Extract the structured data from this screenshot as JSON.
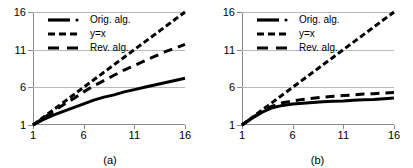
{
  "figure": {
    "panels": [
      {
        "caption": "(a)"
      },
      {
        "caption": "(b)"
      }
    ]
  },
  "legend": {
    "entries": [
      {
        "label": "Orig. alg.",
        "style": "solid-thick-dot",
        "color": "#000000"
      },
      {
        "label": "y=x",
        "style": "short-dash",
        "color": "#000000"
      },
      {
        "label": "Rev. alg.",
        "style": "long-dash",
        "color": "#000000"
      }
    ]
  },
  "axis": {
    "x_ticks": [
      "1",
      "6",
      "11",
      "16"
    ],
    "y_ticks": [
      "1",
      "6",
      "11",
      "16"
    ]
  },
  "chart_data": [
    {
      "type": "line",
      "title": "",
      "panel_label": "(a)",
      "xlabel": "",
      "ylabel": "",
      "xlim": [
        1,
        16
      ],
      "ylim": [
        1,
        16
      ],
      "xticks": [
        1,
        6,
        11,
        16
      ],
      "yticks": [
        1,
        6,
        11,
        16
      ],
      "grid": "horizontal",
      "legend_position": "top-left",
      "x": [
        1,
        2,
        3,
        4,
        5,
        6,
        7,
        8,
        9,
        10,
        11,
        12,
        13,
        14,
        15,
        16
      ],
      "series": [
        {
          "name": "Orig. alg.",
          "style": "solid-thick-dot",
          "values": [
            1.0,
            1.7,
            2.3,
            2.8,
            3.3,
            3.8,
            4.3,
            4.7,
            5.0,
            5.4,
            5.7,
            6.0,
            6.3,
            6.6,
            6.9,
            7.2
          ]
        },
        {
          "name": "y=x",
          "style": "short-dash",
          "values": [
            1,
            2,
            3,
            4,
            5,
            6,
            7,
            8,
            9,
            10,
            11,
            12,
            13,
            14,
            15,
            16
          ]
        },
        {
          "name": "Rev. alg.",
          "style": "long-dash",
          "values": [
            1.0,
            1.9,
            2.8,
            3.7,
            4.5,
            5.4,
            6.2,
            6.9,
            7.6,
            8.3,
            8.9,
            9.5,
            10.1,
            10.7,
            11.2,
            11.7
          ]
        }
      ]
    },
    {
      "type": "line",
      "title": "",
      "panel_label": "(b)",
      "xlabel": "",
      "ylabel": "",
      "xlim": [
        1,
        16
      ],
      "ylim": [
        1,
        16
      ],
      "xticks": [
        1,
        6,
        11,
        16
      ],
      "yticks": [
        1,
        6,
        11,
        16
      ],
      "grid": "horizontal",
      "legend_position": "top-left",
      "x": [
        1,
        2,
        3,
        4,
        5,
        6,
        7,
        8,
        9,
        10,
        11,
        12,
        13,
        14,
        15,
        16
      ],
      "series": [
        {
          "name": "Orig. alg.",
          "style": "solid-thick-dot",
          "values": [
            1.0,
            1.9,
            2.7,
            3.3,
            3.6,
            3.8,
            3.9,
            4.0,
            4.1,
            4.15,
            4.2,
            4.3,
            4.35,
            4.4,
            4.5,
            4.6
          ]
        },
        {
          "name": "y=x",
          "style": "short-dash",
          "values": [
            1,
            2,
            3,
            4,
            5,
            6,
            7,
            8,
            9,
            10,
            11,
            12,
            13,
            14,
            15,
            16
          ]
        },
        {
          "name": "Rev. alg.",
          "style": "long-dash",
          "values": [
            1.0,
            1.95,
            2.85,
            3.5,
            3.95,
            4.2,
            4.4,
            4.55,
            4.7,
            4.8,
            4.9,
            5.0,
            5.1,
            5.15,
            5.25,
            5.3
          ]
        }
      ]
    }
  ]
}
